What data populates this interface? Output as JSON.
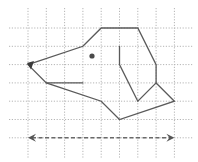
{
  "figure": {
    "grid": {
      "origin_x": 28,
      "origin_y": 28,
      "spacing": 18.3,
      "columns": 9,
      "rows": 7,
      "extent": {
        "x_min": 9,
        "x_max": 193,
        "y_min": 8,
        "y_max": 158
      },
      "line_color": "#b5b5b5"
    },
    "dog_head": {
      "outline_points_grid": [
        [
          0,
          2
        ],
        [
          3,
          1
        ],
        [
          4,
          0
        ],
        [
          6,
          0
        ],
        [
          7,
          2
        ],
        [
          7,
          3
        ],
        [
          8,
          4
        ],
        [
          5,
          5
        ],
        [
          4,
          4
        ],
        [
          1,
          3
        ]
      ],
      "mouth_points_grid": [
        [
          1,
          3
        ],
        [
          3,
          3
        ]
      ],
      "ear_points_grid": [
        [
          5,
          1
        ],
        [
          5,
          2
        ],
        [
          6,
          4
        ],
        [
          7,
          3
        ]
      ],
      "eye_center": [
        92,
        56
      ],
      "nose_at_grid": [
        0,
        2
      ],
      "stroke_color": "#5a5a5a"
    },
    "arrow": {
      "type": "double-headed dashed",
      "from_grid": [
        0,
        6
      ],
      "to_grid": [
        8,
        6
      ],
      "color": "#6a6a6a"
    }
  }
}
